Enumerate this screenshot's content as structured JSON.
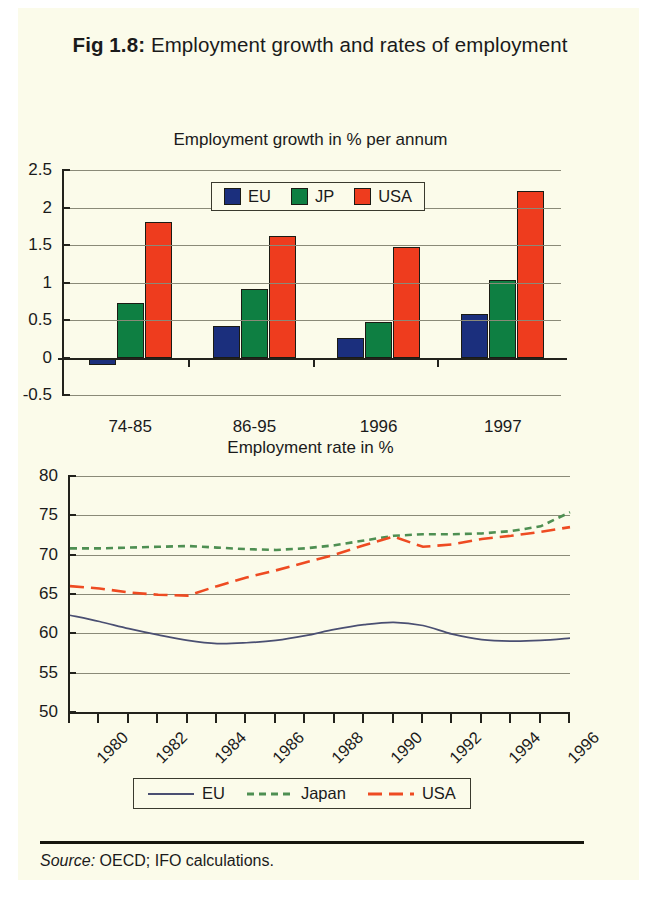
{
  "figure": {
    "label": "Fig 1.8:",
    "title": "Employment growth and rates of employment",
    "source_prefix": "Source:",
    "source_text": "OECD; IFO calculations."
  },
  "colors": {
    "eu": "#1b2f7d",
    "jp": "#0e7f42",
    "usa": "#ee3c1e",
    "eu_line": "#4a4f72",
    "jp_line": "#4e8f52",
    "usa_line": "#ee4b22",
    "paper": "#fbfbea",
    "grid": "#8a8a78",
    "axis": "#22221c"
  },
  "chart_data": [
    {
      "type": "bar",
      "title": "Employment growth in % per annum",
      "xlabel": "",
      "ylabel": "",
      "ylim": [
        -0.5,
        2.5
      ],
      "yticks": [
        "2.5",
        "2",
        "1.5",
        "1",
        "0.5",
        "0",
        "-0.5"
      ],
      "ytick_values": [
        2.5,
        2,
        1.5,
        1,
        0.5,
        0,
        -0.5
      ],
      "grid": true,
      "legend_position": "top-center",
      "categories": [
        "74-85",
        "86-95",
        "1996",
        "1997"
      ],
      "series": [
        {
          "name": "EU",
          "color_key": "eu",
          "values": [
            -0.1,
            0.42,
            0.26,
            0.58
          ]
        },
        {
          "name": "JP",
          "color_key": "jp",
          "values": [
            0.73,
            0.92,
            0.48,
            1.03
          ]
        },
        {
          "name": "USA",
          "color_key": "usa",
          "values": [
            1.81,
            1.62,
            1.48,
            2.22
          ]
        }
      ]
    },
    {
      "type": "line",
      "title": "Employment rate in %",
      "xlabel": "",
      "ylabel": "",
      "ylim": [
        50,
        80
      ],
      "yticks": [
        "80",
        "75",
        "70",
        "65",
        "60",
        "55",
        "50"
      ],
      "ytick_values": [
        80,
        75,
        70,
        65,
        60,
        55,
        50
      ],
      "grid": true,
      "legend_position": "bottom-center",
      "x": [
        1980,
        1981,
        1982,
        1983,
        1984,
        1985,
        1986,
        1987,
        1988,
        1989,
        1990,
        1991,
        1992,
        1993,
        1994,
        1995,
        1996,
        1997
      ],
      "xlim": [
        1980,
        1997
      ],
      "xtick_labels": [
        "1980",
        "1982",
        "1984",
        "1986",
        "1988",
        "1990",
        "1992",
        "1994",
        "1996"
      ],
      "xtick_label_values": [
        1980,
        1982,
        1984,
        1986,
        1988,
        1990,
        1992,
        1994,
        1996
      ],
      "series": [
        {
          "name": "EU",
          "color_key": "eu_line",
          "style": "solid",
          "values": [
            62.3,
            61.5,
            60.6,
            59.8,
            59.1,
            58.7,
            58.8,
            59.1,
            59.7,
            60.5,
            61.1,
            61.4,
            61.0,
            59.9,
            59.2,
            59.0,
            59.1,
            59.4
          ]
        },
        {
          "name": "Japan",
          "color_key": "jp_line",
          "style": "dotted",
          "values": [
            70.8,
            70.8,
            70.9,
            71.0,
            71.1,
            70.9,
            70.7,
            70.6,
            70.8,
            71.2,
            71.8,
            72.4,
            72.6,
            72.6,
            72.7,
            73.0,
            73.6,
            75.4
          ]
        },
        {
          "name": "USA",
          "color_key": "usa_line",
          "style": "dashed",
          "values": [
            66.0,
            65.7,
            65.2,
            64.9,
            64.8,
            66.0,
            67.1,
            68.0,
            69.0,
            70.0,
            71.2,
            72.3,
            71.0,
            71.3,
            72.0,
            72.4,
            72.9,
            73.5
          ]
        }
      ]
    }
  ]
}
